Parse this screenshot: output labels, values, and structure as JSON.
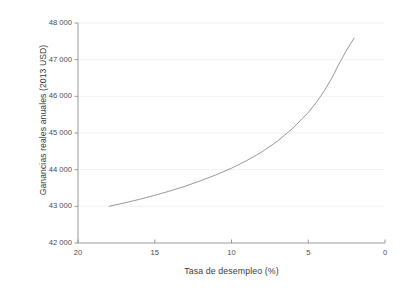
{
  "chart_data": {
    "type": "line",
    "title": "",
    "xlabel": "Tasa de desempleo (%)",
    "ylabel": "Ganancias reales anuales (2013 USD)",
    "xlim": [
      20,
      0
    ],
    "ylim": [
      42000,
      48000
    ],
    "x_reversed": true,
    "grid": "horizontal",
    "legend": "none",
    "xticks": [
      20,
      15,
      10,
      5,
      0
    ],
    "xtick_labels": [
      "20",
      "15",
      "10",
      "5",
      "0"
    ],
    "yticks": [
      42000,
      43000,
      44000,
      45000,
      46000,
      47000,
      48000
    ],
    "ytick_labels": [
      "42 000",
      "43 000",
      "44 000",
      "45 000",
      "46 000",
      "47 000",
      "48 000"
    ],
    "series": [
      {
        "name": "Ganancias reales anuales",
        "color": "#8c8c8c",
        "x": [
          18.0,
          17.0,
          16.0,
          15.0,
          14.0,
          13.0,
          12.0,
          11.0,
          10.0,
          9.0,
          8.0,
          7.0,
          6.0,
          5.0,
          4.5,
          4.0,
          3.5,
          3.0,
          2.5,
          2.0
        ],
        "y": [
          43000,
          43090,
          43190,
          43300,
          43420,
          43550,
          43700,
          43860,
          44040,
          44250,
          44490,
          44780,
          45130,
          45560,
          45820,
          46120,
          46470,
          46880,
          47260,
          47600
        ]
      }
    ]
  },
  "axes": {
    "x_axis_name": "x-axis",
    "y_axis_name": "y-axis"
  },
  "colors": {
    "grid": "#ededed",
    "axis": "#8f8f8f",
    "curve": "#8c8c8c",
    "text": "#3b3b3b",
    "tick_text": "#4a4a4a"
  }
}
